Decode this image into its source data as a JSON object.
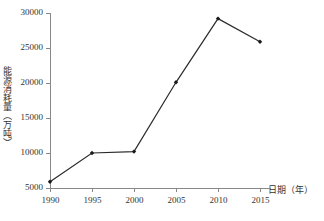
{
  "chart_data": {
    "type": "line",
    "title": "",
    "xlabel": "日期（年）",
    "ylabel": "能源消耗量（万吨）",
    "categories": [
      "1990",
      "1995",
      "2000",
      "2005",
      "2010",
      "2015"
    ],
    "x": [
      1990,
      1995,
      2000,
      2005,
      2010,
      2015
    ],
    "values": [
      5900,
      10000,
      10200,
      20100,
      29200,
      25900
    ],
    "series": [
      {
        "name": "能源消耗量",
        "values": [
          5900,
          10000,
          10200,
          20100,
          29200,
          25900
        ]
      }
    ],
    "xlim": [
      1990,
      2015
    ],
    "ylim": [
      5000,
      30000
    ],
    "ytick_labels": [
      "5000",
      "10000",
      "15000",
      "20000",
      "25000",
      "30000"
    ],
    "ytick_values": [
      5000,
      10000,
      15000,
      20000,
      25000,
      30000
    ],
    "xtick_labels": [
      "1990",
      "1995",
      "2000",
      "2005",
      "2010",
      "2015"
    ],
    "grid": false,
    "legend": false,
    "legend_position": "none",
    "line_color": "#2b2b2b",
    "marker_color": "#1a1a1a",
    "marker_shape": "diamond",
    "axis_color": "#888888",
    "text_color": "#333333",
    "background_color": "#ffffff"
  }
}
